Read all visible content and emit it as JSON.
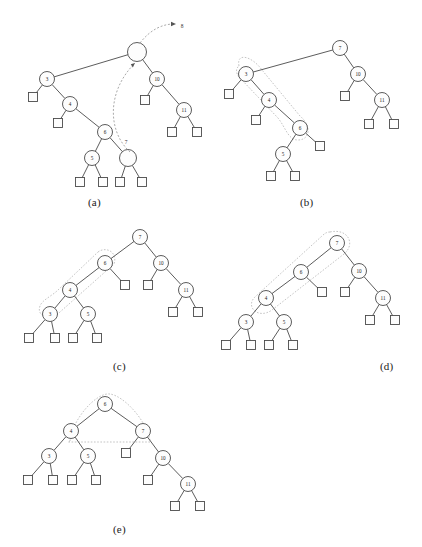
{
  "figure": {
    "panels": [
      {
        "id": "a",
        "label": "(a)",
        "label_x": 88,
        "label_y": 196,
        "annotations": [
          {
            "name": "insert-value-label",
            "text": "8",
            "x": 182,
            "y": 26
          },
          {
            "name": "search-path-label",
            "text": "7",
            "x": 126,
            "y": 142
          }
        ],
        "nodes": [
          {
            "id": "root",
            "value": "",
            "x": 137,
            "y": 52,
            "r": 9.5
          },
          {
            "id": "n3",
            "value": "3",
            "x": 47,
            "y": 79,
            "r": 7.5
          },
          {
            "id": "n10",
            "value": "10",
            "x": 157,
            "y": 79,
            "r": 7.5
          },
          {
            "id": "n4",
            "value": "4",
            "x": 70,
            "y": 104,
            "r": 7.5
          },
          {
            "id": "n11",
            "value": "11",
            "x": 184,
            "y": 110,
            "r": 7.5
          },
          {
            "id": "n6",
            "value": "6",
            "x": 105,
            "y": 132,
            "r": 7.5
          },
          {
            "id": "n5",
            "value": "5",
            "x": 92,
            "y": 158,
            "r": 7.5
          },
          {
            "id": "nempty",
            "value": "",
            "x": 128,
            "y": 158,
            "r": 8.5
          }
        ],
        "leaves": [
          {
            "id": "l1",
            "x": 33,
            "y": 97,
            "s": 9
          },
          {
            "id": "l2",
            "x": 145,
            "y": 100,
            "s": 9
          },
          {
            "id": "l3",
            "x": 58,
            "y": 123,
            "s": 9
          },
          {
            "id": "l4",
            "x": 172,
            "y": 132,
            "s": 9
          },
          {
            "id": "l5",
            "x": 197,
            "y": 132,
            "s": 9
          },
          {
            "id": "l6",
            "x": 80,
            "y": 182,
            "s": 9
          },
          {
            "id": "l7",
            "x": 103,
            "y": 182,
            "s": 9
          },
          {
            "id": "l8",
            "x": 120,
            "y": 182,
            "s": 9
          },
          {
            "id": "l9",
            "x": 142,
            "y": 182,
            "s": 9
          }
        ],
        "edges": [
          [
            "root",
            "n3"
          ],
          [
            "root",
            "n10"
          ],
          [
            "n3",
            "l1"
          ],
          [
            "n3",
            "n4"
          ],
          [
            "n10",
            "l2"
          ],
          [
            "n10",
            "n11"
          ],
          [
            "n4",
            "l3"
          ],
          [
            "n4",
            "n6"
          ],
          [
            "n11",
            "l4"
          ],
          [
            "n11",
            "l5"
          ],
          [
            "n6",
            "n5"
          ],
          [
            "n6",
            "nempty"
          ],
          [
            "n5",
            "l6"
          ],
          [
            "n5",
            "l7"
          ],
          [
            "nempty",
            "l8"
          ],
          [
            "nempty",
            "l9"
          ]
        ],
        "curve": "M 130 152 C 108 132, 106 92, 135 63",
        "arrow_tip": {
          "x": 135,
          "y": 63
        },
        "out_curve": "M 140 43 C 150 30, 162 24, 174 24",
        "out_arrow_tip": {
          "x": 176,
          "y": 24
        }
      },
      {
        "id": "b",
        "label": "(b)",
        "label_x": 300,
        "label_y": 196,
        "annotations": [],
        "nodes": [
          {
            "id": "n7",
            "value": "7",
            "x": 340,
            "y": 48,
            "r": 7.5
          },
          {
            "id": "n3",
            "value": "3",
            "x": 246,
            "y": 74,
            "r": 7.5
          },
          {
            "id": "n10",
            "value": "10",
            "x": 358,
            "y": 74,
            "r": 7.5
          },
          {
            "id": "n4",
            "value": "4",
            "x": 269,
            "y": 100,
            "r": 7.5
          },
          {
            "id": "n11",
            "value": "11",
            "x": 382,
            "y": 100,
            "r": 7.5
          },
          {
            "id": "n6",
            "value": "6",
            "x": 300,
            "y": 128,
            "r": 7.5
          },
          {
            "id": "n5",
            "value": "5",
            "x": 283,
            "y": 154,
            "r": 7.5
          }
        ],
        "leaves": [
          {
            "id": "l1",
            "x": 229,
            "y": 94,
            "s": 9
          },
          {
            "id": "l2",
            "x": 345,
            "y": 96,
            "s": 9
          },
          {
            "id": "l3",
            "x": 256,
            "y": 120,
            "s": 9
          },
          {
            "id": "l4",
            "x": 369,
            "y": 124,
            "s": 9
          },
          {
            "id": "l5",
            "x": 394,
            "y": 124,
            "s": 9
          },
          {
            "id": "l6",
            "x": 320,
            "y": 146,
            "s": 9
          },
          {
            "id": "l7",
            "x": 271,
            "y": 176,
            "s": 9
          },
          {
            "id": "l8",
            "x": 295,
            "y": 176,
            "s": 9
          }
        ],
        "edges": [
          [
            "n7",
            "n3"
          ],
          [
            "n7",
            "n10"
          ],
          [
            "n3",
            "l1"
          ],
          [
            "n3",
            "n4"
          ],
          [
            "n10",
            "l2"
          ],
          [
            "n10",
            "n11"
          ],
          [
            "n4",
            "l3"
          ],
          [
            "n4",
            "n6"
          ],
          [
            "n11",
            "l4"
          ],
          [
            "n11",
            "l5"
          ],
          [
            "n6",
            "n5"
          ],
          [
            "n6",
            "l6"
          ],
          [
            "n5",
            "l7"
          ],
          [
            "n5",
            "l8"
          ]
        ],
        "highlight": "M 239 66 C 236 52, 252 56, 262 70 L 300 116 C 312 126, 310 140, 298 140 C 288 140, 286 128, 278 118 L 240 78 C 235 73, 236 68, 239 66 Z"
      },
      {
        "id": "c",
        "label": "(c)",
        "label_x": 113,
        "label_y": 360,
        "annotations": [],
        "nodes": [
          {
            "id": "n7",
            "value": "7",
            "x": 140,
            "y": 237,
            "r": 7.5
          },
          {
            "id": "n6",
            "value": "6",
            "x": 105,
            "y": 263,
            "r": 7.5
          },
          {
            "id": "n10",
            "value": "10",
            "x": 161,
            "y": 263,
            "r": 7.5
          },
          {
            "id": "n4",
            "value": "4",
            "x": 70,
            "y": 290,
            "r": 7.5
          },
          {
            "id": "n11",
            "value": "11",
            "x": 186,
            "y": 290,
            "r": 7.5
          },
          {
            "id": "n3",
            "value": "3",
            "x": 50,
            "y": 314,
            "r": 7.5
          },
          {
            "id": "n5",
            "value": "5",
            "x": 88,
            "y": 314,
            "r": 7.5
          }
        ],
        "leaves": [
          {
            "id": "l1",
            "x": 125,
            "y": 285,
            "s": 9
          },
          {
            "id": "l2",
            "x": 148,
            "y": 285,
            "s": 9
          },
          {
            "id": "l3",
            "x": 173,
            "y": 312,
            "s": 9
          },
          {
            "id": "l4",
            "x": 198,
            "y": 312,
            "s": 9
          },
          {
            "id": "l5",
            "x": 29,
            "y": 338,
            "s": 9
          },
          {
            "id": "l6",
            "x": 55,
            "y": 338,
            "s": 9
          },
          {
            "id": "l7",
            "x": 73,
            "y": 338,
            "s": 9
          },
          {
            "id": "l8",
            "x": 97,
            "y": 338,
            "s": 9
          }
        ],
        "edges": [
          [
            "n7",
            "n6"
          ],
          [
            "n7",
            "n10"
          ],
          [
            "n6",
            "n4"
          ],
          [
            "n6",
            "l1"
          ],
          [
            "n10",
            "l2"
          ],
          [
            "n10",
            "n11"
          ],
          [
            "n4",
            "n3"
          ],
          [
            "n4",
            "n5"
          ],
          [
            "n11",
            "l3"
          ],
          [
            "n11",
            "l4"
          ],
          [
            "n3",
            "l5"
          ],
          [
            "n3",
            "l6"
          ],
          [
            "n5",
            "l7"
          ],
          [
            "n5",
            "l8"
          ]
        ],
        "highlight": "M 98 252 C 106 246, 118 252, 114 264 L 60 312 C 50 322, 36 316, 40 306 C 42 300, 52 296, 58 290 Z"
      },
      {
        "id": "d",
        "label": "(d)",
        "label_x": 380,
        "label_y": 360,
        "annotations": [],
        "nodes": [
          {
            "id": "n7",
            "value": "7",
            "x": 337,
            "y": 243,
            "r": 7.5
          },
          {
            "id": "n6",
            "value": "6",
            "x": 301,
            "y": 272,
            "r": 7.5
          },
          {
            "id": "n10",
            "value": "10",
            "x": 359,
            "y": 271,
            "r": 7.5
          },
          {
            "id": "n4",
            "value": "4",
            "x": 266,
            "y": 298,
            "r": 7.5
          },
          {
            "id": "n11",
            "value": "11",
            "x": 383,
            "y": 298,
            "r": 7.5
          },
          {
            "id": "n3",
            "value": "3",
            "x": 246,
            "y": 322,
            "r": 7.5
          },
          {
            "id": "n5",
            "value": "5",
            "x": 284,
            "y": 322,
            "r": 7.5
          }
        ],
        "leaves": [
          {
            "id": "l1",
            "x": 322,
            "y": 292,
            "s": 9
          },
          {
            "id": "l2",
            "x": 345,
            "y": 292,
            "s": 9
          },
          {
            "id": "l3",
            "x": 370,
            "y": 320,
            "s": 9
          },
          {
            "id": "l4",
            "x": 395,
            "y": 320,
            "s": 9
          },
          {
            "id": "l5",
            "x": 226,
            "y": 345,
            "s": 9
          },
          {
            "id": "l6",
            "x": 251,
            "y": 345,
            "s": 9
          },
          {
            "id": "l7",
            "x": 269,
            "y": 345,
            "s": 9
          },
          {
            "id": "l8",
            "x": 293,
            "y": 345,
            "s": 9
          }
        ],
        "edges": [
          [
            "n7",
            "n6"
          ],
          [
            "n7",
            "n10"
          ],
          [
            "n6",
            "n4"
          ],
          [
            "n6",
            "l1"
          ],
          [
            "n10",
            "l2"
          ],
          [
            "n10",
            "n11"
          ],
          [
            "n4",
            "n3"
          ],
          [
            "n4",
            "n5"
          ],
          [
            "n11",
            "l3"
          ],
          [
            "n11",
            "l4"
          ],
          [
            "n3",
            "l5"
          ],
          [
            "n3",
            "l6"
          ],
          [
            "n5",
            "l7"
          ],
          [
            "n5",
            "l8"
          ]
        ],
        "highlight": "M 330 232 C 348 228, 356 244, 344 254 L 272 310 C 258 320, 244 306, 256 296 L 322 236 C 325 233, 327 232, 330 232 Z"
      },
      {
        "id": "e",
        "label": "(e)",
        "label_x": 113,
        "label_y": 523,
        "annotations": [],
        "nodes": [
          {
            "id": "n6",
            "value": "6",
            "x": 105,
            "y": 404,
            "r": 7.5
          },
          {
            "id": "n4",
            "value": "4",
            "x": 71,
            "y": 431,
            "r": 7.5
          },
          {
            "id": "n7",
            "value": "7",
            "x": 143,
            "y": 431,
            "r": 7.5
          },
          {
            "id": "n3",
            "value": "3",
            "x": 49,
            "y": 456,
            "r": 7.5
          },
          {
            "id": "n5",
            "value": "5",
            "x": 88,
            "y": 456,
            "r": 7.5
          },
          {
            "id": "n10",
            "value": "10",
            "x": 163,
            "y": 458,
            "r": 7.5
          },
          {
            "id": "n11",
            "value": "11",
            "x": 188,
            "y": 484,
            "r": 7.5
          }
        ],
        "leaves": [
          {
            "id": "l1",
            "x": 28,
            "y": 480,
            "s": 9
          },
          {
            "id": "l2",
            "x": 53,
            "y": 480,
            "s": 9
          },
          {
            "id": "l3",
            "x": 72,
            "y": 480,
            "s": 9
          },
          {
            "id": "l4",
            "x": 96,
            "y": 480,
            "s": 9
          },
          {
            "id": "l5",
            "x": 126,
            "y": 453,
            "s": 9
          },
          {
            "id": "l6",
            "x": 148,
            "y": 480,
            "s": 9
          },
          {
            "id": "l7",
            "x": 175,
            "y": 506,
            "s": 9
          },
          {
            "id": "l8",
            "x": 200,
            "y": 506,
            "s": 9
          }
        ],
        "edges": [
          [
            "n6",
            "n4"
          ],
          [
            "n6",
            "n7"
          ],
          [
            "n4",
            "n3"
          ],
          [
            "n4",
            "n5"
          ],
          [
            "n7",
            "l5"
          ],
          [
            "n7",
            "n10"
          ],
          [
            "n3",
            "l1"
          ],
          [
            "n3",
            "l2"
          ],
          [
            "n5",
            "l3"
          ],
          [
            "n5",
            "l4"
          ],
          [
            "n10",
            "l6"
          ],
          [
            "n10",
            "n11"
          ],
          [
            "n11",
            "l7"
          ],
          [
            "n11",
            "l8"
          ]
        ],
        "highlight": "M 70 441 C 72 420, 96 392, 110 394 C 124 396, 146 420, 150 440 L 150 442 L 68 442 Z"
      }
    ]
  }
}
